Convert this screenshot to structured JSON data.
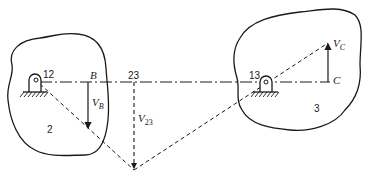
{
  "diagram": {
    "type": "kinematic velocity diagram (Kennedy instant centers)",
    "bodies": [
      {
        "id": "body-2",
        "label": "2"
      },
      {
        "id": "body-3",
        "label": "3"
      }
    ],
    "pivots": [
      {
        "id": "pivot-12",
        "label": "12"
      },
      {
        "id": "pivot-13",
        "label": "13"
      }
    ],
    "points": {
      "B": "B",
      "instant_center_23": "23",
      "C": "C"
    },
    "velocities": {
      "vB": {
        "main": "V",
        "sub": "B"
      },
      "v23": {
        "main": "V",
        "sub": "23"
      },
      "vC": {
        "main": "V",
        "sub": "C"
      }
    },
    "colors": {
      "ink": "#1a1a1a",
      "background": "#ffffff"
    }
  }
}
